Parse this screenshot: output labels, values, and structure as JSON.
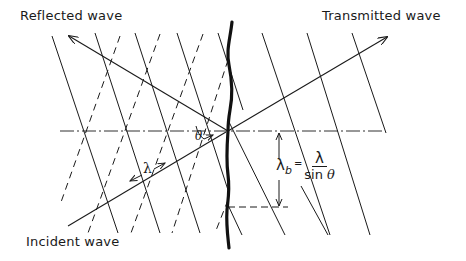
{
  "diagram": {
    "labels": {
      "reflected": "Reflected wave",
      "transmitted": "Transmitted wave",
      "incident": "Incident wave",
      "lambda": "λ",
      "theta": "θ"
    },
    "formula": {
      "lhs": "λ",
      "lhs_sub": "b",
      "equals": "=",
      "numerator": "λ",
      "denominator_fn": "sin",
      "denominator_var": "θ"
    },
    "colors": {
      "ink": "#1a1a1a",
      "background": "#ffffff"
    }
  }
}
